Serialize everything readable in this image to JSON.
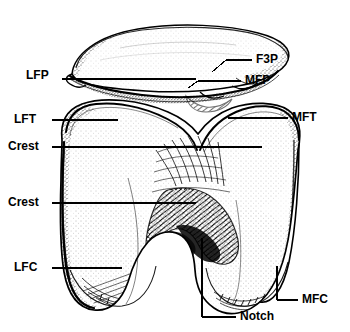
{
  "figure": {
    "title": "F. 2.2",
    "background_color": "#ffffff",
    "ink_color": "#000000",
    "width": 350,
    "height": 332
  },
  "labels": [
    {
      "id": "lfp",
      "text": "LFP",
      "side": "left",
      "x": 26,
      "y": 75,
      "leader_from_x": 62,
      "leader_to_x": 196,
      "leader_y": 79,
      "target": "lateral-facet-patella"
    },
    {
      "id": "f3p",
      "text": "F3P",
      "side": "right",
      "x": 256,
      "y": 54,
      "leader_from_x": 252,
      "leader_to_x": 224,
      "leader_y": 60,
      "target": "third-facet-patella"
    },
    {
      "id": "mfp",
      "text": "MFP",
      "side": "right",
      "x": 245,
      "y": 75,
      "leader_from_x": 241,
      "leader_to_x": 198,
      "leader_y": 81,
      "target": "medial-facet-patella"
    },
    {
      "id": "lft",
      "text": "LFT",
      "side": "left",
      "x": 14,
      "y": 113,
      "leader_from_x": 52,
      "leader_to_x": 118,
      "leader_y": 120,
      "target": "lateral-facet-trochlea"
    },
    {
      "id": "mft",
      "text": "MFT",
      "side": "right",
      "x": 292,
      "y": 111,
      "leader_from_x": 288,
      "leader_to_x": 228,
      "leader_y": 118,
      "target": "medial-facet-trochlea"
    },
    {
      "id": "crest1",
      "text": "Crest",
      "side": "left",
      "x": 8,
      "y": 140,
      "leader_from_x": 52,
      "leader_to_x": 262,
      "leader_y": 147,
      "target": "trochlear-crest-upper"
    },
    {
      "id": "crest2",
      "text": "Crest",
      "side": "left",
      "x": 8,
      "y": 196,
      "leader_from_x": 52,
      "leader_to_x": 196,
      "leader_y": 203,
      "target": "trochlear-crest-lower"
    },
    {
      "id": "lfc",
      "text": "LFC",
      "side": "left",
      "x": 14,
      "y": 261,
      "leader_from_x": 52,
      "leader_to_x": 122,
      "leader_y": 268,
      "target": "lateral-femoral-condyle"
    },
    {
      "id": "mfc",
      "text": "MFC",
      "side": "right",
      "x": 302,
      "y": 294,
      "leader_from_x": 298,
      "leader_to_x": 277,
      "leader_y": 300,
      "target": "medial-femoral-condyle"
    },
    {
      "id": "notch",
      "text": "Notch",
      "side": "right",
      "x": 240,
      "y": 310,
      "leader_from_x": 236,
      "leader_to_x": 202,
      "leader_y": 317,
      "target": "intercondylar-notch"
    }
  ]
}
